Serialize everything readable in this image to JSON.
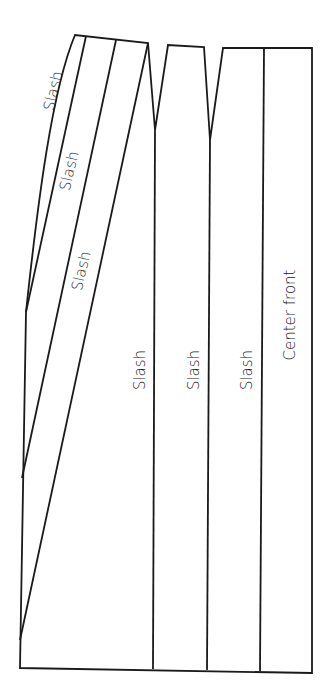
{
  "diagram": {
    "type": "sewing-pattern-slash-lines",
    "stroke_color": "#1a1a1a",
    "background": "#ffffff",
    "labels": {
      "diag_slash_1": "Slash",
      "diag_slash_2": "Slash",
      "diag_slash_3": "Slash",
      "vert_slash_1": "Slash",
      "vert_slash_2": "Slash",
      "vert_slash_3": "Slash",
      "center_front": "Center front"
    },
    "panels": [
      {
        "name": "side-panel-with-diagonal-slashes"
      },
      {
        "name": "panel-2"
      },
      {
        "name": "panel-3"
      },
      {
        "name": "center-front-panel"
      }
    ]
  }
}
